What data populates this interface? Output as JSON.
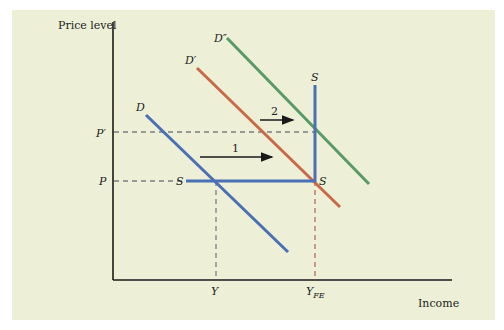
{
  "diagram": {
    "axes": {
      "y_label": "Price level",
      "x_label": "Income"
    },
    "price_levels": [
      {
        "id": "p",
        "label": "P"
      },
      {
        "id": "p_prime",
        "label": "P′"
      }
    ],
    "income_levels": [
      {
        "id": "y",
        "label": "Y",
        "subscript": ""
      },
      {
        "id": "y_fe",
        "label": "Y",
        "subscript": "FE"
      }
    ],
    "curves": [
      {
        "id": "d",
        "label": "D",
        "color": "#4A6FB5"
      },
      {
        "id": "d_prime",
        "label": "D′",
        "color": "#C86A4A"
      },
      {
        "id": "d_double_prime",
        "label": "D″",
        "color": "#5A9A66"
      },
      {
        "id": "s",
        "label_left": "S",
        "label_top": "S",
        "label_corner": "S",
        "color": "#4A6FB5"
      }
    ],
    "shifts": [
      {
        "id": "shift-1",
        "label": "1"
      },
      {
        "id": "shift-2",
        "label": "2"
      }
    ],
    "colors": {
      "background": "#EDF0D7",
      "axis": "#1a1a1a",
      "dashed_gray": "#7a7f80",
      "dashed_red": "#B07060",
      "arrow": "#1a1a1a"
    }
  }
}
